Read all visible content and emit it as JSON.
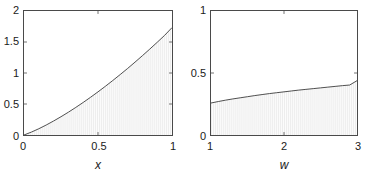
{
  "figure": {
    "background": "#ffffff",
    "axis_color": "#4a4a4a",
    "curve_color": "#3a3a3a",
    "fill_color": "#fbfbfb",
    "hatch_color": "#e8e8e8"
  },
  "chart_data": [
    {
      "id": "left-panel",
      "type": "area",
      "title": "",
      "xlabel": "x",
      "ylabel": "",
      "xlim": [
        0,
        1
      ],
      "ylim": [
        0,
        2
      ],
      "xticks": [
        0,
        0.5,
        1
      ],
      "xticklabels": [
        "0",
        "0.5",
        "1"
      ],
      "yticks": [
        0,
        0.5,
        1,
        1.5,
        2
      ],
      "yticklabels": [
        "0",
        "0.5",
        "1",
        "1.5",
        "2"
      ],
      "grid": false,
      "legend": "none",
      "fill": "under-curve",
      "series": [
        {
          "name": "curve",
          "x": [
            0,
            0.05,
            0.1,
            0.15,
            0.2,
            0.25,
            0.3,
            0.35,
            0.4,
            0.45,
            0.5,
            0.55,
            0.6,
            0.65,
            0.7,
            0.75,
            0.8,
            0.85,
            0.9,
            0.95,
            1
          ],
          "values": [
            0,
            0.047,
            0.101,
            0.161,
            0.226,
            0.295,
            0.368,
            0.445,
            0.525,
            0.609,
            0.696,
            0.786,
            0.879,
            0.975,
            1.073,
            1.175,
            1.279,
            1.386,
            1.495,
            1.607,
            1.732
          ]
        }
      ]
    },
    {
      "id": "right-panel",
      "type": "area",
      "title": "",
      "xlabel": "w",
      "ylabel": "",
      "xlim": [
        1,
        3
      ],
      "ylim": [
        0,
        1
      ],
      "xticks": [
        1,
        2,
        3
      ],
      "xticklabels": [
        "1",
        "2",
        "3"
      ],
      "yticks": [
        0,
        0.5,
        1
      ],
      "yticklabels": [
        "0",
        "0.5",
        "1"
      ],
      "grid": false,
      "legend": "none",
      "fill": "under-curve",
      "series": [
        {
          "name": "curve",
          "x": [
            1,
            1.1,
            1.2,
            1.3,
            1.4,
            1.5,
            1.6,
            1.7,
            1.8,
            1.9,
            2,
            2.1,
            2.2,
            2.3,
            2.4,
            2.5,
            2.6,
            2.7,
            2.8,
            2.9,
            3
          ],
          "values": [
            0.258,
            0.27,
            0.281,
            0.291,
            0.3,
            0.309,
            0.318,
            0.326,
            0.334,
            0.341,
            0.348,
            0.355,
            0.362,
            0.368,
            0.374,
            0.38,
            0.386,
            0.392,
            0.398,
            0.403,
            0.438
          ]
        }
      ]
    }
  ],
  "panels": {
    "left": {
      "xlabel": "x",
      "yticklabels": [
        "2",
        "1.5",
        "1",
        "0.5",
        "0"
      ],
      "xticklabels": [
        "0",
        "0.5",
        "1"
      ]
    },
    "right": {
      "xlabel": "w",
      "yticklabels": [
        "1",
        "0.5",
        "0"
      ],
      "xticklabels": [
        "1",
        "2",
        "3"
      ]
    }
  }
}
